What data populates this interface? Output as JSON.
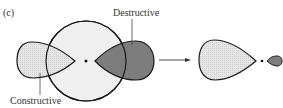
{
  "figure": {
    "panel_label": "(c)",
    "labels": {
      "destructive": "Destructive",
      "constructive": "Constructive"
    },
    "colors": {
      "circle_fill": "#eeeeee",
      "light_lobe_fill": "#d9d9d9",
      "dark_lobe_fill": "#7a7a7a",
      "stroke": "#1a1a1a"
    },
    "shapes": [
      {
        "name": "s-orbital-circle",
        "description": "Large circle centered on nucleus"
      },
      {
        "name": "left-lobe",
        "description": "Light-shaded p lobe, left (constructive overlap)"
      },
      {
        "name": "right-lobe",
        "description": "Dark-shaded p lobe, right (destructive overlap)"
      },
      {
        "name": "arrow",
        "description": "Arrow pointing to resulting hybrid orbital"
      },
      {
        "name": "hybrid-large-lobe",
        "description": "Large light lobe of resulting hybrid"
      },
      {
        "name": "hybrid-small-lobe",
        "description": "Small dark lobe of resulting hybrid"
      }
    ]
  }
}
